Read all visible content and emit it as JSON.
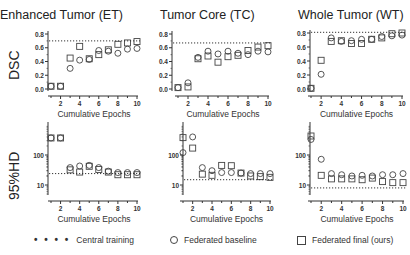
{
  "chart_data": [
    {
      "type": "scatter",
      "panel": "top-left",
      "title": "Enhanced Tumor (ET)",
      "row_label": "DSC",
      "xlabel": "Cumulative Epochs",
      "ylabel": "DSC",
      "x": [
        1,
        2,
        3,
        4,
        5,
        6,
        7,
        8,
        9,
        10
      ],
      "xticks": [
        "2",
        "4",
        "6",
        "8",
        "10"
      ],
      "yticks": [
        "0.0",
        "0.2",
        "0.4",
        "0.6",
        "0.8"
      ],
      "ylim": [
        0,
        0.8
      ],
      "yscale": "linear",
      "series": [
        {
          "name": "Federated baseline",
          "marker": "circle",
          "values": [
            0.04,
            0.04,
            0.3,
            0.42,
            0.43,
            0.56,
            0.55,
            0.52,
            0.58,
            0.59
          ]
        },
        {
          "name": "Federated final (ours)",
          "marker": "square",
          "values": [
            0.04,
            0.04,
            0.45,
            0.62,
            0.44,
            0.5,
            0.57,
            0.65,
            0.67,
            0.69
          ]
        },
        {
          "name": "Central training",
          "marker": "dotted-line",
          "value": 0.7
        }
      ]
    },
    {
      "type": "scatter",
      "panel": "top-middle",
      "title": "Tumor Core (TC)",
      "xlabel": "Cumulative Epochs",
      "ylabel": "DSC",
      "x": [
        1,
        2,
        3,
        4,
        5,
        6,
        7,
        8,
        9,
        10
      ],
      "xticks": [
        "2",
        "4",
        "6",
        "8",
        "10"
      ],
      "yticks": [
        "0.0",
        "0.2",
        "0.4",
        "0.6",
        "0.8"
      ],
      "ylim": [
        0,
        0.8
      ],
      "yscale": "linear",
      "series": [
        {
          "name": "Federated baseline",
          "marker": "circle",
          "values": [
            0.02,
            0.09,
            0.46,
            0.55,
            0.51,
            0.55,
            0.52,
            0.5,
            0.55,
            0.54
          ]
        },
        {
          "name": "Federated final (ours)",
          "marker": "square",
          "values": [
            0.02,
            0.03,
            0.44,
            0.48,
            0.39,
            0.47,
            0.49,
            0.56,
            0.61,
            0.63
          ]
        },
        {
          "name": "Central training",
          "marker": "dotted-line",
          "value": 0.67
        }
      ]
    },
    {
      "type": "scatter",
      "panel": "top-right",
      "title": "Whole Tumor  (WT)",
      "xlabel": "Cumulative Epochs",
      "ylabel": "DSC",
      "x": [
        1,
        2,
        3,
        4,
        5,
        6,
        7,
        8,
        9,
        10
      ],
      "xticks": [
        "2",
        "4",
        "6",
        "8",
        "10"
      ],
      "yticks": [
        "0.0",
        "0.2",
        "0.4",
        "0.6",
        "0.8"
      ],
      "ylim": [
        0,
        0.8
      ],
      "yscale": "linear",
      "series": [
        {
          "name": "Federated baseline",
          "marker": "circle",
          "values": [
            0.01,
            0.21,
            0.73,
            0.68,
            0.69,
            0.71,
            0.71,
            0.75,
            0.76,
            0.77
          ]
        },
        {
          "name": "Federated final (ours)",
          "marker": "square",
          "values": [
            0.01,
            0.41,
            0.68,
            0.69,
            0.65,
            0.65,
            0.71,
            0.73,
            0.79,
            0.8
          ]
        },
        {
          "name": "Central training",
          "marker": "dotted-line",
          "value": 0.81
        }
      ]
    },
    {
      "type": "scatter",
      "panel": "bottom-left",
      "row_label": "95%HD",
      "xlabel": "Cumulative Epochs",
      "ylabel": "95%HD",
      "x": [
        1,
        2,
        3,
        4,
        5,
        6,
        7,
        8,
        9,
        10
      ],
      "xticks": [
        "2",
        "4",
        "6",
        "8",
        "10"
      ],
      "yticks": [
        "10",
        "100"
      ],
      "yscale": "log",
      "ylim": [
        5,
        600
      ],
      "series": [
        {
          "name": "Federated baseline",
          "marker": "circle",
          "values": [
            370,
            370,
            38,
            43,
            45,
            38,
            29,
            26,
            26,
            26
          ]
        },
        {
          "name": "Federated final (ours)",
          "marker": "square",
          "values": [
            370,
            370,
            32,
            27,
            42,
            33,
            27,
            22,
            22,
            22
          ]
        },
        {
          "name": "Central training",
          "marker": "dotted-line",
          "value": 24
        }
      ]
    },
    {
      "type": "scatter",
      "panel": "bottom-middle",
      "xlabel": "Cumulative Epochs",
      "ylabel": "95%HD",
      "x": [
        1,
        2,
        3,
        4,
        5,
        6,
        7,
        8,
        9,
        10
      ],
      "xticks": [
        "2",
        "4",
        "6",
        "8",
        "10"
      ],
      "yticks": [
        "10",
        "100"
      ],
      "yscale": "log",
      "ylim": [
        5,
        600
      ],
      "series": [
        {
          "name": "Federated baseline",
          "marker": "circle",
          "values": [
            120,
            400,
            38,
            30,
            26,
            26,
            25,
            24,
            24,
            24
          ]
        },
        {
          "name": "Federated final (ours)",
          "marker": "square",
          "values": [
            380,
            170,
            23,
            21,
            45,
            44,
            25,
            20,
            19,
            18
          ]
        },
        {
          "name": "Central training",
          "marker": "dotted-line",
          "value": 15
        }
      ]
    },
    {
      "type": "scatter",
      "panel": "bottom-right",
      "xlabel": "Cumulative Epochs",
      "ylabel": "95%HD",
      "x": [
        1,
        2,
        3,
        4,
        5,
        6,
        7,
        8,
        9,
        10
      ],
      "xticks": [
        "2",
        "4",
        "6",
        "8",
        "10"
      ],
      "yticks": [
        "10",
        "100"
      ],
      "yscale": "log",
      "ylim": [
        5,
        600
      ],
      "series": [
        {
          "name": "Federated baseline",
          "marker": "circle",
          "values": [
            330,
            72,
            24,
            22,
            20,
            21,
            20,
            22,
            22,
            24
          ]
        },
        {
          "name": "Federated final (ours)",
          "marker": "square",
          "values": [
            430,
            21,
            16,
            16,
            16,
            15,
            17,
            13,
            12,
            12
          ]
        },
        {
          "name": "Central training",
          "marker": "dotted-line",
          "value": 8
        }
      ]
    }
  ],
  "titles": {
    "et": "Enhanced Tumor (ET)",
    "tc": "Tumor  Core (TC)",
    "wt": "Whole Tumor  (WT)"
  },
  "row_labels": {
    "top": "DSC",
    "bottom": "95%HD"
  },
  "xlabel": "Cumulative Epochs",
  "legend": {
    "central": "Central training",
    "baseline": "Federated baseline",
    "final": "Federated final (ours)"
  }
}
